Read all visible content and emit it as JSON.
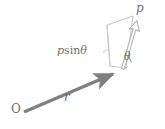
{
  "figure": {
    "background_color": "#ffffff",
    "width": 165,
    "height": 129
  },
  "colors": {
    "vector_r": "#808080",
    "vector_p": "#b3b3b3",
    "parallelogram_stroke": "#c9c9c9",
    "label_text": "#6f6f6f",
    "angle_arc": "#9a9a9a"
  },
  "labels": {
    "origin": "O",
    "vector_r": "r",
    "vector_p": "p",
    "perpendicular_component": "p sin θ",
    "perpendicular_component_p": "p",
    "perpendicular_component_sin": "sin",
    "perpendicular_component_theta": "θ",
    "angle": "θ"
  },
  "geometry": {
    "origin_point": [
      22,
      113
    ],
    "r_tip": [
      122,
      70
    ],
    "p_tip": [
      137,
      22
    ],
    "parallelogram_points": [
      [
        107,
        25
      ],
      [
        133,
        16
      ],
      [
        125,
        68
      ],
      [
        110,
        66
      ]
    ],
    "angle_degrees": 38
  }
}
